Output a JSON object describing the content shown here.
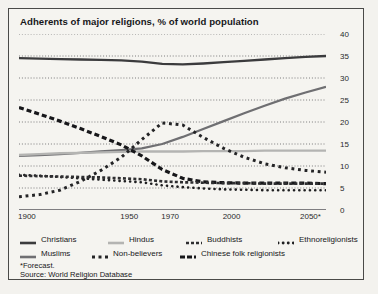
{
  "chart_data": {
    "type": "line",
    "title": "Adherents of major religions, % of world population",
    "xlabel": "",
    "ylabel": "",
    "ylim": [
      0,
      40
    ],
    "xlim": [
      1900,
      2050
    ],
    "yticks": [
      0,
      5,
      10,
      15,
      20,
      25,
      30,
      35,
      40
    ],
    "xticks": [
      1900,
      1950,
      1970,
      2000,
      2050
    ],
    "xtick_labels": [
      "1900",
      "1950",
      "1970",
      "2000",
      "2050*"
    ],
    "grid": "horizontal-dotted",
    "legend_position": "below-axes",
    "x": [
      1900,
      1910,
      1920,
      1930,
      1940,
      1950,
      1960,
      1970,
      1980,
      1990,
      2000,
      2010,
      2020,
      2030,
      2040,
      2050
    ],
    "series": [
      {
        "name": "Christians",
        "style": "solid",
        "color": "#3b3b3d",
        "width": 2.3,
        "values": [
          34.5,
          34.4,
          34.3,
          34.2,
          34.1,
          34.0,
          33.7,
          33.2,
          33.1,
          33.3,
          33.6,
          33.9,
          34.2,
          34.5,
          34.8,
          35.0
        ]
      },
      {
        "name": "Muslims",
        "style": "solid",
        "color": "#6f6f72",
        "width": 2.3,
        "values": [
          12.3,
          12.5,
          12.7,
          13.0,
          13.3,
          13.6,
          14.0,
          15.0,
          16.6,
          18.4,
          20.2,
          22.0,
          23.7,
          25.3,
          26.7,
          28.0
        ]
      },
      {
        "name": "Hindus",
        "style": "solid",
        "color": "#b4b4b2",
        "width": 2.3,
        "values": [
          12.5,
          12.7,
          12.9,
          13.0,
          13.1,
          13.2,
          13.3,
          13.3,
          13.3,
          13.4,
          13.4,
          13.4,
          13.5,
          13.5,
          13.5,
          13.5
        ]
      },
      {
        "name": "Non-believers",
        "style": "dotted",
        "color": "#242426",
        "width": 3.0,
        "values": [
          3.0,
          3.5,
          4.5,
          6.5,
          9.0,
          12.0,
          16.0,
          19.8,
          19.3,
          16.5,
          14.0,
          12.0,
          10.5,
          9.6,
          9.0,
          8.6
        ]
      },
      {
        "name": "Chinese folk religionists",
        "style": "dashed",
        "color": "#17171a",
        "width": 3.2,
        "values": [
          23.3,
          21.8,
          20.2,
          18.5,
          16.7,
          14.8,
          12.3,
          9.2,
          7.2,
          6.4,
          6.2,
          6.1,
          6.1,
          6.1,
          6.1,
          6.0
        ]
      },
      {
        "name": "Ethnoreligionists",
        "style": "dotted-round",
        "color": "#1f1f21",
        "width": 2.6,
        "values": [
          8.0,
          7.8,
          7.5,
          7.2,
          6.9,
          6.6,
          6.3,
          5.6,
          5.2,
          4.9,
          4.7,
          4.6,
          4.5,
          4.5,
          4.5,
          4.5
        ]
      },
      {
        "name": "Buddhists",
        "style": "dashed-short",
        "color": "#2e2e30",
        "width": 2.6,
        "values": [
          7.8,
          7.7,
          7.6,
          7.5,
          7.4,
          7.2,
          7.0,
          6.5,
          6.3,
          6.2,
          6.1,
          6.1,
          6.0,
          6.0,
          6.0,
          6.0
        ]
      }
    ]
  },
  "legend": {
    "row1": [
      {
        "label": "Christians",
        "swatch": "solid-dark"
      },
      {
        "label": "Hindus",
        "swatch": "solid-light"
      },
      {
        "label": "Buddhists",
        "swatch": "dash-short"
      },
      {
        "label": "Ethnoreligionists",
        "swatch": "dot-round"
      }
    ],
    "row2": [
      {
        "label": "Muslims",
        "swatch": "solid-gray"
      },
      {
        "label": "Non-believers",
        "swatch": "dot-square"
      },
      {
        "label": "Chinese folk religionists",
        "swatch": "dash-thick"
      }
    ]
  },
  "footnotes": {
    "forecast": "*Forecast.",
    "source": "Source: World Religion Database"
  }
}
